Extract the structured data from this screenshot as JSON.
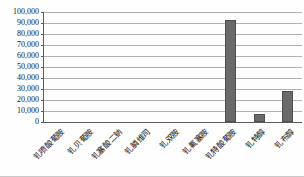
{
  "chart_data": {
    "type": "bar",
    "title": "",
    "xlabel": "",
    "ylabel": "",
    "categories": [
      "钆喷酸葡胺",
      "钆贝葡胺",
      "钆塞酸二钠",
      "钆膦维司",
      "钆双胺",
      "钆氟塞胺",
      "钆特酸葡胺",
      "钆特醇",
      "钆布醇"
    ],
    "values": [
      0,
      0,
      0,
      0,
      0,
      0,
      93000,
      7500,
      28000
    ],
    "ylim": [
      0,
      100000
    ],
    "y_tick_step": 10000,
    "y_tick_labels": [
      "100,000",
      "90,000",
      "80,000",
      "70,000",
      "60,000",
      "50,000",
      "40,000",
      "30,000",
      "20,000",
      "10,000",
      "0"
    ],
    "grid": true,
    "legend": "none",
    "colors": {
      "bar_fill": "#6a6a6a",
      "bar_border": "#4f4f4f",
      "gridline": "#b3b3b3",
      "axis": "#5a5a5a",
      "tick_text": "#1a1a1a"
    }
  }
}
